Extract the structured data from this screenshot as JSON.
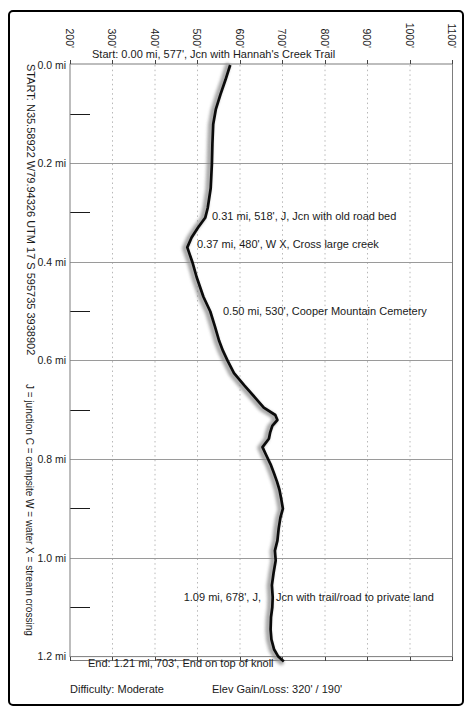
{
  "header": {
    "start_annotation": "Start: 0.00 mi, 577', Jcn with Hannah's Creek Trail"
  },
  "sidebar": {
    "coords": "START: N35.58922 W79.94326  UTM 17 S 595735 3938902",
    "legend": "J = junction  C = campsite  W = water  X = stream crossing"
  },
  "axes": {
    "elevation_ticks": [
      "200'",
      "300'",
      "400'",
      "500'",
      "600'",
      "700'",
      "800'",
      "900'",
      "1000'",
      "1100'"
    ],
    "mile_ticks": [
      "0.0 mi",
      "0.2 mi",
      "0.4 mi",
      "0.6 mi",
      "0.8 mi",
      "1.0 mi",
      "1.2 mi"
    ]
  },
  "annotations": {
    "wp_031": "0.31 mi, 518', J, Jcn with old road bed",
    "wp_037": "0.37 mi, 480', W X, Cross large creek",
    "wp_050": "0.50 mi, 530', Cooper Mountain Cemetery",
    "wp_109_left": "1.09 mi, 678', J,",
    "wp_109_right": "Jcn with trail/road to private land",
    "end": "End: 1.21 mi, 703', End on top of knoll"
  },
  "footer": {
    "difficulty": "Difficulty: Moderate",
    "gain_loss": "Elev Gain/Loss: 320' / 190'"
  },
  "colors": {
    "profile_line": "#0b0b0b",
    "profile_shadow": "#8c8c8c",
    "grid_major": "#9a9a9a",
    "grid_minor_dotted": "#b8b8b8",
    "plot_border": "#7d7d7d",
    "outer_border": "#000000",
    "text": "#1a1a1a",
    "background": "#ffffff"
  },
  "chart_data": {
    "type": "line",
    "xlabel": "Elevation (feet), ticks rotated along top axis",
    "ylabel": "Distance (miles), increasing downward",
    "x_range_ft": [
      200,
      1100
    ],
    "x_tick_step_ft": 100,
    "y_range_mi": [
      0.0,
      1.2
    ],
    "y_major_step_mi": 0.2,
    "y_minor_step_mi": 0.1,
    "grid": "vertical dotted line per 100 ft; solid horizontal line per 0.2 mi; short minor tick per 0.1 mi on left edge",
    "legend_position": "none",
    "difficulty": "Moderate",
    "elev_gain_ft": 320,
    "elev_loss_ft": 190,
    "start_coordinates": "N35.58922 W79.94326 / UTM 17 S 595735 3938902",
    "waypoints": [
      {
        "mile": 0.0,
        "elevation_ft": 577,
        "label": "Jcn with Hannah's Creek Trail"
      },
      {
        "mile": 0.31,
        "elevation_ft": 518,
        "label": "J, Jcn with old road bed"
      },
      {
        "mile": 0.37,
        "elevation_ft": 480,
        "label": "W X, Cross large creek"
      },
      {
        "mile": 0.5,
        "elevation_ft": 530,
        "label": "Cooper Mountain Cemetery"
      },
      {
        "mile": 1.09,
        "elevation_ft": 678,
        "label": "J, Jcn with trail/road to private land"
      },
      {
        "mile": 1.21,
        "elevation_ft": 703,
        "label": "End on top of knoll"
      }
    ],
    "profile_trace": [
      [
        0.0,
        577
      ],
      [
        0.03,
        566
      ],
      [
        0.06,
        554
      ],
      [
        0.09,
        543
      ],
      [
        0.12,
        537
      ],
      [
        0.16,
        535
      ],
      [
        0.2,
        534
      ],
      [
        0.25,
        531
      ],
      [
        0.29,
        524
      ],
      [
        0.31,
        518
      ],
      [
        0.33,
        501
      ],
      [
        0.35,
        486
      ],
      [
        0.37,
        476
      ],
      [
        0.4,
        488
      ],
      [
        0.43,
        498
      ],
      [
        0.47,
        514
      ],
      [
        0.5,
        530
      ],
      [
        0.53,
        541
      ],
      [
        0.56,
        551
      ],
      [
        0.58,
        560
      ],
      [
        0.6,
        571
      ],
      [
        0.625,
        586
      ],
      [
        0.65,
        610
      ],
      [
        0.675,
        636
      ],
      [
        0.695,
        656
      ],
      [
        0.71,
        683
      ],
      [
        0.72,
        688
      ],
      [
        0.732,
        676
      ],
      [
        0.745,
        671
      ],
      [
        0.758,
        668
      ],
      [
        0.775,
        653
      ],
      [
        0.79,
        661
      ],
      [
        0.81,
        672
      ],
      [
        0.828,
        680
      ],
      [
        0.845,
        687
      ],
      [
        0.862,
        693
      ],
      [
        0.88,
        697
      ],
      [
        0.9,
        701
      ],
      [
        0.918,
        695
      ],
      [
        0.94,
        691
      ],
      [
        0.965,
        688
      ],
      [
        0.985,
        682
      ],
      [
        1.005,
        684
      ],
      [
        1.03,
        679
      ],
      [
        1.055,
        675
      ],
      [
        1.08,
        677
      ],
      [
        1.1,
        676
      ],
      [
        1.12,
        673
      ],
      [
        1.145,
        672
      ],
      [
        1.165,
        674
      ],
      [
        1.185,
        680
      ],
      [
        1.2,
        690
      ],
      [
        1.21,
        703
      ]
    ]
  }
}
